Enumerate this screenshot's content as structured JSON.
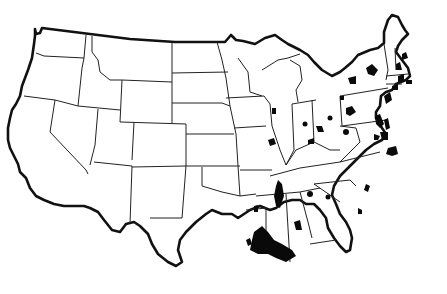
{
  "map": {
    "title": "Outline map of the contiguous United States with highlighted (black) areas",
    "region": "Contiguous United States",
    "style": "black-and-white outline with state boundaries",
    "colors": {
      "background": "#ffffff",
      "outline": "#111111",
      "highlight": "#0a0a0a"
    },
    "highlighted_areas": [
      {
        "state": "Louisiana",
        "location": "Mississippi River delta / New Orleans area (large)"
      },
      {
        "state": "Mississippi",
        "location": "Western Mississippi along the river (Delta region)"
      },
      {
        "state": "Arkansas",
        "location": "Southwest Arkansas small area"
      },
      {
        "state": "Texas",
        "location": "Upper Texas coast near Houston"
      },
      {
        "state": "Alabama",
        "location": "Central Alabama (Birmingham area)"
      },
      {
        "state": "Alabama",
        "location": "Mobile / Gulf coast"
      },
      {
        "state": "Georgia",
        "location": "Western Georgia (Columbus area)"
      },
      {
        "state": "Georgia",
        "location": "Savannah coast"
      },
      {
        "state": "South Carolina",
        "location": "Charleston coast"
      },
      {
        "state": "North Carolina",
        "location": "Outer coast / Albemarle area"
      },
      {
        "state": "Virginia",
        "location": "Hampton Roads / Norfolk"
      },
      {
        "state": "Virginia",
        "location": "Central Virginia"
      },
      {
        "state": "Maryland",
        "location": "Chesapeake Bay / Baltimore"
      },
      {
        "state": "Delaware",
        "location": "Delaware Bay coast"
      },
      {
        "state": "New Jersey",
        "location": "Northern New Jersey / NYC area"
      },
      {
        "state": "New York",
        "location": "Hudson Valley / Albany"
      },
      {
        "state": "New York",
        "location": "Lake Ontario shore (Rochester/Syracuse)"
      },
      {
        "state": "Pennsylvania",
        "location": "Western Pennsylvania (Pittsburgh)"
      },
      {
        "state": "Ohio",
        "location": "Central Ohio (Columbus)"
      },
      {
        "state": "Ohio",
        "location": "Southern Ohio river (Cincinnati)"
      },
      {
        "state": "Ohio",
        "location": "Lake Erie shore (Toledo/Cleveland)"
      },
      {
        "state": "West Virginia",
        "location": "Central West Virginia"
      },
      {
        "state": "Indiana",
        "location": "Central Indiana (Indianapolis)"
      },
      {
        "state": "Indiana",
        "location": "Southern Indiana / Louisville area"
      },
      {
        "state": "Illinois",
        "location": "Western Illinois river area"
      },
      {
        "state": "Illinois",
        "location": "St. Louis / Mississippi river area"
      },
      {
        "state": "Massachusetts",
        "location": "Boston area"
      },
      {
        "state": "Massachusetts",
        "location": "Cape Cod / southeastern coast"
      },
      {
        "state": "New Hampshire",
        "location": "Southern New Hampshire"
      },
      {
        "state": "Maine",
        "location": "Coastal Maine (Portland)"
      },
      {
        "state": "Connecticut",
        "location": "Connecticut coast"
      }
    ]
  }
}
